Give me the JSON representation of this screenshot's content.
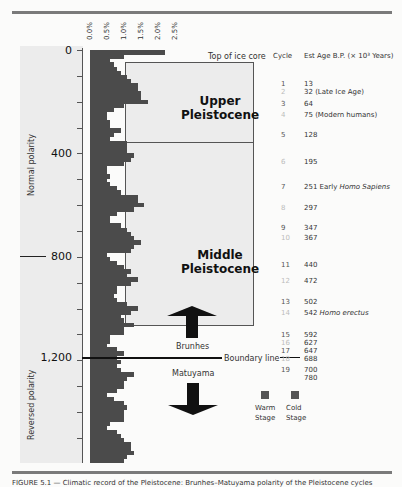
{
  "figure": {
    "x_ticks": [
      "0.0%",
      "0.5%",
      "1.0%",
      "1.5%",
      "2.0%",
      "2.5%"
    ],
    "y_labels": [
      "0",
      "400",
      "800",
      "1,200"
    ],
    "top_label": "Top of ice core",
    "epochs": {
      "upper": [
        "Upper",
        "Pleistocene"
      ],
      "middle": [
        "Middle",
        "Pleistocene"
      ]
    },
    "polarity": {
      "normal": "Normal polarity",
      "reversed": "Reversed polarity"
    },
    "brunhes": "Brunhes",
    "matuyama": "Matuyama",
    "boundary_label": "Boundary line",
    "legend": {
      "warm": [
        "Warm",
        "Stage"
      ],
      "cold": [
        "Cold",
        "Stage"
      ]
    },
    "table": {
      "cycle_header": "Cycle",
      "age_header": "Est Age B.P. (× 10³ Years)",
      "rows": [
        {
          "cycle": "1",
          "age": "13",
          "note": "",
          "y": 80
        },
        {
          "cycle": "2",
          "age": "32",
          "note": "(Late Ice Age)",
          "y": 88
        },
        {
          "cycle": "3",
          "age": "64",
          "note": "",
          "y": 100
        },
        {
          "cycle": "4",
          "age": "75",
          "note": "(Modern humans)",
          "y": 111
        },
        {
          "cycle": "5",
          "age": "128",
          "note": "",
          "y": 131
        },
        {
          "cycle": "6",
          "age": "195",
          "note": "",
          "y": 158
        },
        {
          "cycle": "7",
          "age": "251",
          "note": "Early Homo Sapiens",
          "y": 183
        },
        {
          "cycle": "8",
          "age": "297",
          "note": "",
          "y": 204
        },
        {
          "cycle": "9",
          "age": "347",
          "note": "",
          "y": 224
        },
        {
          "cycle": "10",
          "age": "367",
          "note": "",
          "y": 234
        },
        {
          "cycle": "11",
          "age": "440",
          "note": "",
          "y": 261
        },
        {
          "cycle": "12",
          "age": "472",
          "note": "",
          "y": 277
        },
        {
          "cycle": "13",
          "age": "502",
          "note": "",
          "y": 298
        },
        {
          "cycle": "14",
          "age": "542",
          "note": "Homo erectus",
          "y": 309
        },
        {
          "cycle": "15",
          "age": "592",
          "note": "",
          "y": 331
        },
        {
          "cycle": "16",
          "age": "627",
          "note": "",
          "y": 339
        },
        {
          "cycle": "17",
          "age": "647",
          "note": "",
          "y": 347
        },
        {
          "cycle": "18",
          "age": "688",
          "note": "",
          "y": 355
        },
        {
          "cycle": "19",
          "age": "700",
          "note": "",
          "y": 366
        },
        {
          "cycle": "",
          "age": "780",
          "note": "",
          "y": 374
        }
      ]
    },
    "caption": "FIGURE 5.1 — Climatic record of the Pleistocene: Brunhes–Matuyama polarity of the Pleistocene cycles"
  },
  "chart_data": {
    "type": "bar",
    "orientation": "horizontal",
    "title": "",
    "xlabel": "",
    "ylabel": "Depth / Age (×10³ years B.P.)",
    "x_ticks": [
      "0.0%",
      "0.5%",
      "1.0%",
      "1.5%",
      "2.0%",
      "2.5%"
    ],
    "xlim": [
      0,
      2.5
    ],
    "ylim": [
      0,
      1600
    ],
    "y_ticks": [
      0,
      400,
      800,
      1200
    ],
    "grid": false,
    "bar_depth_step": 16,
    "values": [
      2.2,
      1.0,
      0.6,
      0.7,
      0.8,
      0.9,
      1.1,
      1.2,
      1.4,
      1.4,
      1.5,
      1.5,
      1.7,
      1.0,
      0.7,
      0.5,
      0.5,
      0.6,
      0.6,
      0.9,
      0.7,
      0.6,
      1.1,
      1.1,
      1.1,
      1.3,
      1.2,
      1.0,
      0.5,
      0.5,
      0.6,
      0.5,
      0.6,
      0.8,
      0.9,
      1.4,
      1.4,
      1.6,
      1.3,
      0.8,
      0.6,
      0.6,
      0.9,
      1.1,
      1.2,
      1.3,
      1.5,
      1.3,
      1.2,
      0.5,
      0.6,
      0.8,
      1.0,
      1.2,
      1.1,
      1.4,
      1.2,
      0.8,
      0.8,
      0.7,
      0.8,
      1.1,
      1.4,
      1.2,
      0.9,
      1.0,
      1.3,
      1.0,
      1.0,
      0.6,
      0.6,
      0.5,
      0.8,
      1.0,
      0.8,
      0.9,
      0.8,
      0.9,
      1.3,
      1.1,
      1.0,
      1.0,
      0.8,
      0.5,
      0.7,
      1.0,
      1.1,
      1.0,
      1.0,
      1.0,
      0.6,
      0.5,
      0.8,
      0.9,
      1.0,
      1.2,
      1.2,
      1.3,
      1.1,
      1.0
    ],
    "annotations": [
      "Top of ice core",
      "Upper Pleistocene",
      "Middle Pleistocene",
      "Brunhes",
      "Boundary line",
      "Matuyama",
      "Normal polarity",
      "Reversed polarity"
    ],
    "legend": [
      "Warm Stage",
      "Cold Stage"
    ]
  }
}
